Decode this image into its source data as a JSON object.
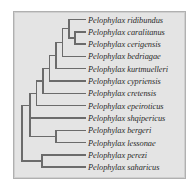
{
  "figure": {
    "kind": "phylogenetic-cladogram",
    "genus": "Pelophylax",
    "background_color": "#e4e4e4",
    "border_color": "#b0b0b0",
    "branch_color": "#6b6b6b",
    "label_color": "#2a2a2a"
  },
  "chart_data": {
    "type": "tree",
    "title": "",
    "xlabel": "",
    "ylabel": "",
    "leaf_count": 13,
    "leaves": [
      "Pelophylax ridibundus",
      "Pelophylax caralitanus",
      "Pelophylax cerigensis",
      "Pelophylax bedriagae",
      "Pelophylax kurtmuelleri",
      "Pelophylax cypriensis",
      "Pelophylax cretensis",
      "Pelophylax epeiroticus",
      "Pelophylax shqipericus",
      "Pelophylax bergeri",
      "Pelophylax lessonae",
      "Pelophylax perezi",
      "Pelophylax saharicus"
    ],
    "newick": "(((((((((ridibundus,(caralitanus,cerigensis)),bedriagae),kurtmuelleri),cypriensis),cretensis),epeiroticus),shqipericus),(bergeri,lessonae)),(perezi,saharicus));"
  },
  "labels": [
    {
      "name": "Pelophylax ridibundus",
      "x": 88,
      "y": 19.5
    },
    {
      "name": "Pelophylax caralitanus",
      "x": 88,
      "y": 31.8
    },
    {
      "name": "Pelophylax cerigensis",
      "x": 88,
      "y": 44.1
    },
    {
      "name": "Pelophylax bedriagae",
      "x": 88,
      "y": 56.4
    },
    {
      "name": "Pelophylax kurtmuelleri",
      "x": 88,
      "y": 68.7
    },
    {
      "name": "Pelophylax cypriensis",
      "x": 88,
      "y": 81.0
    },
    {
      "name": "Pelophylax cretensis",
      "x": 88,
      "y": 93.3
    },
    {
      "name": "Pelophylax epeiroticus",
      "x": 88,
      "y": 105.6
    },
    {
      "name": "Pelophylax shqipericus",
      "x": 88,
      "y": 117.9
    },
    {
      "name": "Pelophylax bergeri",
      "x": 88,
      "y": 130.2
    },
    {
      "name": "Pelophylax lessonae",
      "x": 88,
      "y": 142.5
    },
    {
      "name": "Pelophylax perezi",
      "x": 88,
      "y": 154.8
    },
    {
      "name": "Pelophylax saharicus",
      "x": 88,
      "y": 167.1
    }
  ],
  "branches": {
    "stroke_width": 1.4,
    "horizontal": [
      {
        "id": "h-ridibundus",
        "x1": 69.0,
        "x2": 85.0,
        "y": 19.5
      },
      {
        "id": "h-caralitanus",
        "x1": 75.0,
        "x2": 85.0,
        "y": 31.8
      },
      {
        "id": "h-cerigensis",
        "x1": 75.0,
        "x2": 85.0,
        "y": 44.1
      },
      {
        "id": "h-node-car-cer",
        "x1": 69.0,
        "x2": 75.0,
        "y": 37.95
      },
      {
        "id": "h-bedriagae",
        "x1": 62.5,
        "x2": 85.0,
        "y": 56.4
      },
      {
        "id": "h-node-rid-cer",
        "x1": 62.5,
        "x2": 69.0,
        "y": 28.7
      },
      {
        "id": "h-kurtmuelleri",
        "x1": 56.0,
        "x2": 85.0,
        "y": 68.7
      },
      {
        "id": "h-node-bed",
        "x1": 56.0,
        "x2": 62.5,
        "y": 42.5
      },
      {
        "id": "h-cypriensis",
        "x1": 49.5,
        "x2": 85.0,
        "y": 81.0
      },
      {
        "id": "h-node-kur",
        "x1": 49.5,
        "x2": 56.0,
        "y": 55.6
      },
      {
        "id": "h-cretensis",
        "x1": 43.0,
        "x2": 85.0,
        "y": 93.3
      },
      {
        "id": "h-node-cyp",
        "x1": 43.0,
        "x2": 49.5,
        "y": 68.3
      },
      {
        "id": "h-epeiroticus",
        "x1": 36.5,
        "x2": 85.0,
        "y": 105.6
      },
      {
        "id": "h-node-cre",
        "x1": 36.5,
        "x2": 43.0,
        "y": 80.8
      },
      {
        "id": "h-shqipericus",
        "x1": 30.0,
        "x2": 85.0,
        "y": 117.9
      },
      {
        "id": "h-node-epe",
        "x1": 30.0,
        "x2": 36.5,
        "y": 93.2
      },
      {
        "id": "h-bergeri",
        "x1": 56.0,
        "x2": 85.0,
        "y": 130.2
      },
      {
        "id": "h-lessonae",
        "x1": 56.0,
        "x2": 85.0,
        "y": 142.5
      },
      {
        "id": "h-node-ber-les",
        "x1": 30.0,
        "x2": 56.0,
        "y": 136.35
      },
      {
        "id": "h-node-upper",
        "x1": 22.0,
        "x2": 30.0,
        "y": 105.6
      },
      {
        "id": "h-perezi",
        "x1": 42.0,
        "x2": 85.0,
        "y": 154.8
      },
      {
        "id": "h-saharicus",
        "x1": 42.0,
        "x2": 85.0,
        "y": 167.1
      },
      {
        "id": "h-node-per-sah",
        "x1": 22.0,
        "x2": 42.0,
        "y": 160.95
      }
    ],
    "vertical": [
      {
        "id": "v-car-cer",
        "x": 75.0,
        "y1": 31.8,
        "y2": 44.1
      },
      {
        "id": "v-rid-cer",
        "x": 69.0,
        "y1": 19.5,
        "y2": 37.95
      },
      {
        "id": "v-bed",
        "x": 62.5,
        "y1": 28.7,
        "y2": 56.4
      },
      {
        "id": "v-kur",
        "x": 56.0,
        "y1": 42.5,
        "y2": 68.7
      },
      {
        "id": "v-cyp",
        "x": 49.5,
        "y1": 55.6,
        "y2": 81.0
      },
      {
        "id": "v-cre",
        "x": 43.0,
        "y1": 68.3,
        "y2": 93.3
      },
      {
        "id": "v-epe",
        "x": 36.5,
        "y1": 80.8,
        "y2": 105.6
      },
      {
        "id": "v-shq",
        "x": 30.0,
        "y1": 93.2,
        "y2": 117.9
      },
      {
        "id": "v-ber-les",
        "x": 56.0,
        "y1": 130.2,
        "y2": 142.5
      },
      {
        "id": "v-upper",
        "x": 30.0,
        "y1": 105.6,
        "y2": 136.35
      },
      {
        "id": "v-per-sah",
        "x": 42.0,
        "y1": 154.8,
        "y2": 167.1
      },
      {
        "id": "v-root",
        "x": 22.0,
        "y1": 105.6,
        "y2": 160.95
      }
    ]
  }
}
